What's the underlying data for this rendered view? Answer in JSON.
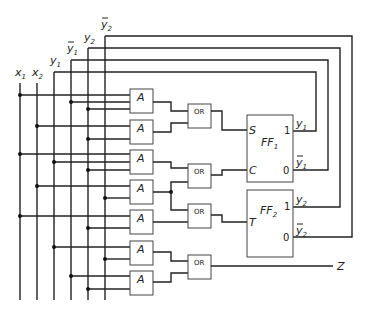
{
  "diagram": {
    "type": "sequential logic circuit",
    "inputs": [
      {
        "name": "x1",
        "label": "x",
        "sub": "1",
        "bar": false
      },
      {
        "name": "x2",
        "label": "x",
        "sub": "2",
        "bar": false
      },
      {
        "name": "y1",
        "label": "y",
        "sub": "1",
        "bar": false
      },
      {
        "name": "y1_bar",
        "label": "y",
        "sub": "1",
        "bar": true
      },
      {
        "name": "y2",
        "label": "y",
        "sub": "2",
        "bar": false
      },
      {
        "name": "y2_bar",
        "label": "y",
        "sub": "2",
        "bar": true
      }
    ],
    "and_gates": [
      {
        "label": "A",
        "inputs": [
          "x1",
          "y1_bar",
          "y2"
        ]
      },
      {
        "label": "A",
        "inputs": [
          "x2",
          "y2"
        ]
      },
      {
        "label": "A",
        "inputs": [
          "x1",
          "y1",
          "y2"
        ]
      },
      {
        "label": "A",
        "inputs": [
          "x2",
          "y2_bar"
        ]
      },
      {
        "label": "A",
        "inputs": [
          "x1",
          "y2"
        ]
      },
      {
        "label": "A",
        "inputs": [
          "y1",
          "y2_bar"
        ]
      },
      {
        "label": "A",
        "inputs": [
          "y1_bar",
          "y2"
        ]
      }
    ],
    "or_gates": [
      {
        "label": "OR",
        "inputs": [
          "A1",
          "A2"
        ],
        "output": "FF1.S"
      },
      {
        "label": "OR",
        "inputs": [
          "A3",
          "A4"
        ],
        "output": "FF1.C"
      },
      {
        "label": "OR",
        "inputs": [
          "A4",
          "A5"
        ],
        "output": "FF2.T"
      },
      {
        "label": "OR",
        "inputs": [
          "A6",
          "A7"
        ],
        "output": "Z"
      }
    ],
    "flip_flops": [
      {
        "name": "FF",
        "sub": "1",
        "inputs": [
          "S",
          "C"
        ],
        "outputs": [
          {
            "pin": "1",
            "label": "y",
            "sub": "1",
            "bar": false
          },
          {
            "pin": "0",
            "label": "y",
            "sub": "1",
            "bar": true
          }
        ]
      },
      {
        "name": "FF",
        "sub": "2",
        "inputs": [
          "T"
        ],
        "outputs": [
          {
            "pin": "1",
            "label": "y",
            "sub": "2",
            "bar": false
          },
          {
            "pin": "0",
            "label": "y",
            "sub": "2",
            "bar": true
          }
        ]
      }
    ],
    "output": {
      "label": "Z"
    }
  },
  "labels": {
    "and": "A",
    "or": "OR",
    "s": "S",
    "c": "C",
    "t": "T",
    "one": "1",
    "zero": "0",
    "ff": "FF",
    "z": "Z",
    "x": "x",
    "y": "y",
    "s1": "1",
    "s2": "2"
  }
}
